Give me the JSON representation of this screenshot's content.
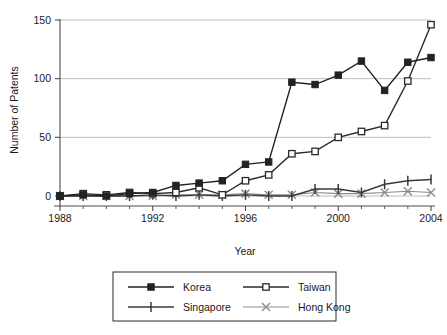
{
  "chart_data": {
    "type": "line",
    "title": "",
    "xlabel": "Year",
    "ylabel": "Number of Patents",
    "x": [
      1988,
      1989,
      1990,
      1991,
      1992,
      1993,
      1994,
      1995,
      1996,
      1997,
      1998,
      1999,
      2000,
      2001,
      2002,
      2003,
      2004
    ],
    "xtick_labels": [
      "1988",
      "1992",
      "1996",
      "2000",
      "2004"
    ],
    "xticks": [
      1988,
      1992,
      1996,
      2000,
      2004
    ],
    "xlim": [
      1988,
      2004
    ],
    "ytick_labels": [
      "0",
      "50",
      "100",
      "150"
    ],
    "yticks": [
      0,
      50,
      100,
      150
    ],
    "ylim": [
      0,
      150
    ],
    "grid": "horizontal",
    "legend_position": "below-center",
    "series": [
      {
        "name": "Korea",
        "marker": "filled-square",
        "color": "#222222",
        "values": [
          0,
          1,
          0,
          2,
          3,
          9,
          11,
          13,
          27,
          29,
          97,
          95,
          103,
          115,
          90,
          114,
          118
        ]
      },
      {
        "name": "Taiwan",
        "marker": "open-square",
        "color": "#2b2b2b",
        "values": [
          0,
          2,
          1,
          3,
          2,
          3,
          7,
          1,
          13,
          18,
          36,
          38,
          50,
          55,
          60,
          98,
          146
        ]
      },
      {
        "name": "Singapore",
        "marker": "plus",
        "color": "#3a3a3a",
        "values": [
          0,
          0,
          0,
          0,
          1,
          0,
          1,
          0,
          1,
          0,
          0,
          6,
          6,
          3,
          10,
          13,
          14
        ]
      },
      {
        "name": "Hong Kong",
        "marker": "cross",
        "color": "#8c8c8c",
        "values": [
          0,
          0,
          0,
          0,
          0,
          1,
          1,
          1,
          2,
          1,
          1,
          3,
          2,
          2,
          3,
          4,
          3
        ]
      }
    ]
  },
  "axes": {
    "y_title": "Number of Patents",
    "x_title": "Year",
    "y_labels": [
      "150",
      "100",
      "50",
      "0"
    ],
    "x_labels": [
      "1988",
      "1992",
      "1996",
      "2000",
      "2004"
    ]
  },
  "legend": {
    "entries": [
      {
        "label": "Korea",
        "marker": "filled-square"
      },
      {
        "label": "Taiwan",
        "marker": "open-square"
      },
      {
        "label": "Singapore",
        "marker": "plus"
      },
      {
        "label": "Hong Kong",
        "marker": "cross"
      }
    ]
  },
  "colors": {
    "korea": "#222222",
    "taiwan": "#2b2b2b",
    "singapore": "#3a3a3a",
    "hongkong": "#8c8c8c",
    "grid": "#b5b5b5",
    "axis": "#4d4d4d",
    "text": "#1a1a1a",
    "background": "#ffffff"
  }
}
